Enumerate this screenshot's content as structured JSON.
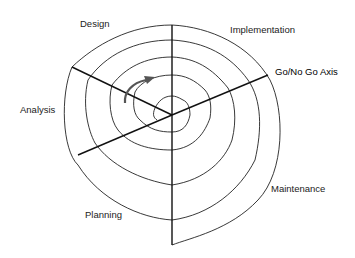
{
  "diagram": {
    "phases": [
      {
        "key": "design",
        "label": "Design"
      },
      {
        "key": "implementation",
        "label": "Implementation"
      },
      {
        "key": "analysis",
        "label": "Analysis"
      },
      {
        "key": "planning",
        "label": "Planning"
      },
      {
        "key": "maintenance",
        "label": "Maintenance"
      }
    ],
    "axis_label": "Go/No Go Axis",
    "colors": {
      "line": "#222222",
      "arrow": "#555555",
      "background": "#ffffff"
    }
  }
}
